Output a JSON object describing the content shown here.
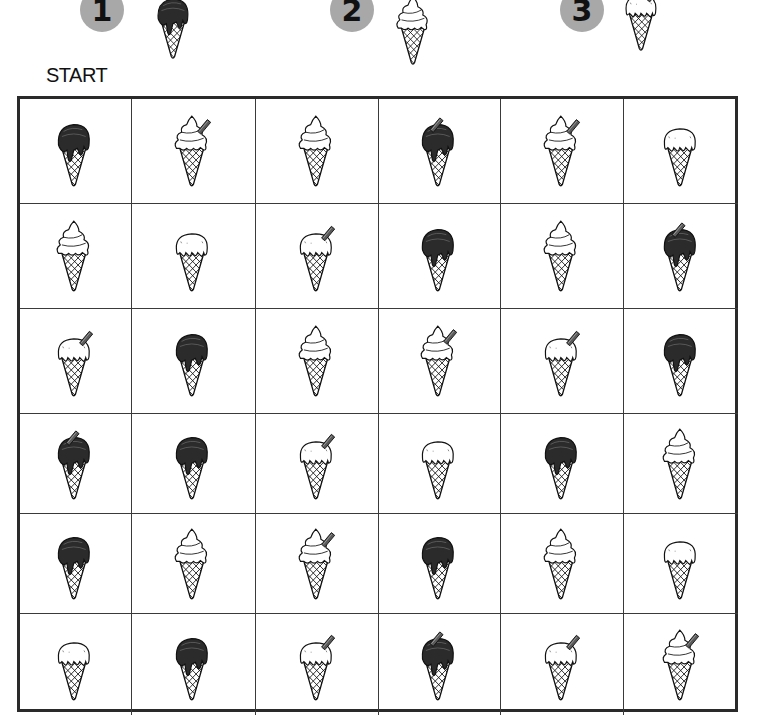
{
  "header": {
    "steps": [
      {
        "number": "1",
        "type": "A",
        "name": "chocolate-scoop"
      },
      {
        "number": "2",
        "type": "B",
        "name": "soft-serve-swirl"
      },
      {
        "number": "3",
        "type": "F",
        "name": "white-scoop-with-flake"
      }
    ],
    "start_label": "START"
  },
  "legend": {
    "A": "chocolate scoop with drips",
    "B": "soft-serve swirl",
    "C": "soft-serve swirl with flake",
    "D": "chocolate scoop with flake",
    "E": "plain white scoop with drips",
    "F": "white scoop with flake"
  },
  "colors": {
    "badge": "#a8a8a8",
    "grid_line": "#2a2a2a",
    "chocolate": "#2b2b2b",
    "flake": "#5a5a5a"
  },
  "grid": {
    "rows": 6,
    "cols": 6,
    "cells": [
      [
        "A",
        "C",
        "B",
        "D",
        "C",
        "E"
      ],
      [
        "B",
        "E",
        "F",
        "A",
        "B",
        "D"
      ],
      [
        "F",
        "A",
        "B",
        "C",
        "F",
        "A"
      ],
      [
        "D",
        "A",
        "F",
        "E",
        "A",
        "B"
      ],
      [
        "A",
        "B",
        "C",
        "A",
        "B",
        "E"
      ],
      [
        "E",
        "A",
        "F",
        "D",
        "F",
        "C"
      ]
    ]
  }
}
